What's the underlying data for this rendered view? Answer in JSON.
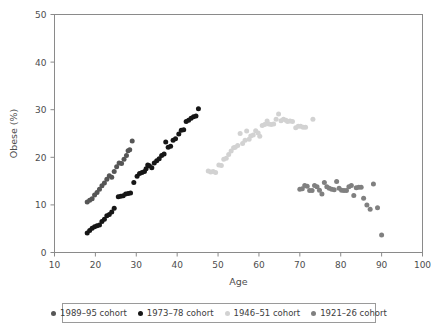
{
  "chart_data": {
    "type": "scatter",
    "title": "",
    "xlabel": "Age",
    "ylabel": "Obese (%)",
    "xlim": [
      10,
      100
    ],
    "ylim": [
      0,
      50
    ],
    "xticks": [
      10,
      20,
      30,
      40,
      50,
      60,
      70,
      80,
      90,
      100
    ],
    "yticks": [
      0,
      10,
      20,
      30,
      40,
      50
    ],
    "grid": false,
    "legend_position": "bottom",
    "series": [
      {
        "name": "1989–95 cohort",
        "color": "#565656",
        "points": [
          [
            18.0,
            10.6
          ],
          [
            18.6,
            11.0
          ],
          [
            19.2,
            11.3
          ],
          [
            19.8,
            12.1
          ],
          [
            20.4,
            12.6
          ],
          [
            21.0,
            13.3
          ],
          [
            21.6,
            14.0
          ],
          [
            22.2,
            14.6
          ],
          [
            22.8,
            15.4
          ],
          [
            23.4,
            16.1
          ],
          [
            24.0,
            15.8
          ],
          [
            24.6,
            17.0
          ],
          [
            25.2,
            18.0
          ],
          [
            25.8,
            18.8
          ],
          [
            26.4,
            18.7
          ],
          [
            27.0,
            19.6
          ],
          [
            27.6,
            20.4
          ],
          [
            28.0,
            21.4
          ],
          [
            28.4,
            21.6
          ],
          [
            29.0,
            23.4
          ]
        ]
      },
      {
        "name": "1973–78 cohort",
        "color": "#161616",
        "points": [
          [
            18.0,
            4.1
          ],
          [
            18.6,
            4.6
          ],
          [
            19.2,
            5.1
          ],
          [
            19.8,
            5.4
          ],
          [
            20.4,
            5.6
          ],
          [
            21.0,
            5.8
          ],
          [
            21.6,
            6.5
          ],
          [
            22.2,
            7.0
          ],
          [
            22.8,
            7.7
          ],
          [
            23.4,
            8.0
          ],
          [
            24.0,
            8.5
          ],
          [
            24.6,
            9.3
          ],
          [
            25.6,
            11.7
          ],
          [
            26.2,
            11.8
          ],
          [
            26.8,
            11.9
          ],
          [
            27.4,
            12.3
          ],
          [
            28.0,
            12.4
          ],
          [
            28.6,
            12.5
          ],
          [
            29.4,
            14.7
          ],
          [
            30.2,
            16.0
          ],
          [
            30.8,
            16.6
          ],
          [
            31.4,
            16.8
          ],
          [
            32.0,
            17.0
          ],
          [
            32.4,
            17.6
          ],
          [
            32.8,
            18.4
          ],
          [
            33.2,
            18.2
          ],
          [
            33.8,
            17.8
          ],
          [
            34.4,
            18.8
          ],
          [
            35.0,
            19.3
          ],
          [
            35.6,
            19.7
          ],
          [
            36.2,
            20.4
          ],
          [
            36.8,
            20.7
          ],
          [
            37.2,
            23.2
          ],
          [
            37.8,
            22.1
          ],
          [
            38.4,
            22.3
          ],
          [
            39.0,
            23.6
          ],
          [
            39.6,
            23.9
          ],
          [
            40.4,
            24.9
          ],
          [
            41.0,
            25.7
          ],
          [
            41.6,
            25.8
          ],
          [
            42.2,
            27.5
          ],
          [
            42.8,
            27.8
          ],
          [
            43.4,
            28.2
          ],
          [
            44.0,
            28.5
          ],
          [
            44.6,
            28.7
          ],
          [
            45.2,
            30.2
          ]
        ]
      },
      {
        "name": "1946–51 cohort",
        "color": "#d2d2d2",
        "points": [
          [
            47.6,
            17.1
          ],
          [
            48.2,
            16.9
          ],
          [
            48.8,
            17.0
          ],
          [
            49.4,
            16.8
          ],
          [
            50.2,
            18.4
          ],
          [
            50.8,
            18.3
          ],
          [
            51.4,
            19.6
          ],
          [
            52.0,
            19.8
          ],
          [
            52.6,
            20.6
          ],
          [
            53.2,
            21.3
          ],
          [
            53.8,
            22.0
          ],
          [
            54.2,
            22.1
          ],
          [
            54.8,
            22.5
          ],
          [
            55.4,
            25.0
          ],
          [
            56.0,
            22.9
          ],
          [
            56.6,
            23.6
          ],
          [
            57.0,
            25.5
          ],
          [
            57.6,
            23.8
          ],
          [
            58.0,
            24.5
          ],
          [
            58.6,
            24.7
          ],
          [
            59.2,
            25.6
          ],
          [
            59.8,
            25.1
          ],
          [
            60.2,
            24.4
          ],
          [
            60.8,
            26.7
          ],
          [
            61.4,
            26.9
          ],
          [
            62.0,
            27.6
          ],
          [
            62.4,
            27.0
          ],
          [
            63.0,
            26.9
          ],
          [
            63.6,
            27.0
          ],
          [
            64.2,
            28.0
          ],
          [
            64.8,
            29.1
          ],
          [
            65.4,
            27.7
          ],
          [
            66.0,
            28.0
          ],
          [
            66.6,
            27.8
          ],
          [
            67.0,
            27.5
          ],
          [
            67.6,
            27.6
          ],
          [
            68.2,
            27.5
          ],
          [
            69.0,
            26.2
          ],
          [
            69.6,
            26.5
          ],
          [
            70.2,
            26.5
          ],
          [
            70.8,
            26.3
          ],
          [
            71.4,
            26.3
          ],
          [
            73.2,
            28.0
          ]
        ]
      },
      {
        "name": "1921–26 cohort",
        "color": "#808080",
        "points": [
          [
            70.0,
            13.3
          ],
          [
            70.6,
            13.4
          ],
          [
            71.2,
            14.1
          ],
          [
            71.8,
            13.9
          ],
          [
            72.4,
            13.0
          ],
          [
            73.0,
            13.0
          ],
          [
            73.6,
            14.1
          ],
          [
            74.2,
            13.8
          ],
          [
            74.8,
            13.1
          ],
          [
            75.4,
            12.3
          ],
          [
            76.0,
            14.7
          ],
          [
            76.6,
            13.8
          ],
          [
            77.2,
            13.5
          ],
          [
            77.8,
            13.3
          ],
          [
            78.4,
            13.2
          ],
          [
            79.0,
            14.9
          ],
          [
            79.6,
            13.5
          ],
          [
            80.2,
            13.1
          ],
          [
            80.8,
            13.0
          ],
          [
            81.4,
            13.0
          ],
          [
            82.0,
            13.8
          ],
          [
            82.6,
            14.1
          ],
          [
            83.2,
            12.0
          ],
          [
            83.8,
            13.6
          ],
          [
            84.4,
            13.7
          ],
          [
            85.0,
            13.7
          ],
          [
            85.6,
            11.4
          ],
          [
            86.4,
            10.0
          ],
          [
            87.2,
            9.1
          ],
          [
            88.0,
            14.4
          ],
          [
            89.0,
            9.4
          ],
          [
            90.0,
            3.7
          ]
        ]
      }
    ]
  },
  "legend": {
    "entries": [
      {
        "label": "1989–95 cohort",
        "color": "#565656"
      },
      {
        "label": "1973–78 cohort",
        "color": "#161616"
      },
      {
        "label": "1946–51 cohort",
        "color": "#d2d2d2"
      },
      {
        "label": "1921–26 cohort",
        "color": "#808080"
      }
    ]
  }
}
